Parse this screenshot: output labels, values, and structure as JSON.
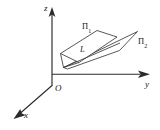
{
  "figure": {
    "background_color": "#ffffff",
    "line_color": "#2b2b2b",
    "plane_edge_color": "#3a3a3a",
    "axes": {
      "z": {
        "label": "z",
        "direction": "up",
        "tip": [
          52,
          10
        ],
        "origin": [
          52,
          85
        ]
      },
      "y": {
        "label": "y",
        "direction": "right",
        "tip": [
          150,
          74
        ],
        "origin": [
          52,
          74
        ]
      },
      "x": {
        "label": "x",
        "direction": "down-left",
        "tip": [
          14,
          118
        ],
        "origin": [
          52,
          85
        ]
      }
    },
    "origin": {
      "label": "O"
    },
    "planes": [
      {
        "name": "plane-1",
        "label": "Π",
        "subscript": "1",
        "vertices": [
          [
            61,
            53
          ],
          [
            97,
            31
          ],
          [
            117,
            37
          ],
          [
            79,
            62
          ]
        ]
      },
      {
        "name": "plane-2",
        "label": "Π",
        "subscript": "2",
        "vertices": [
          [
            63,
            67
          ],
          [
            137,
            32
          ],
          [
            120,
            49
          ],
          [
            68,
            68
          ]
        ]
      }
    ],
    "intersection_line": {
      "label": "L",
      "from": [
        63,
        67
      ],
      "to": [
        120,
        43
      ]
    }
  }
}
